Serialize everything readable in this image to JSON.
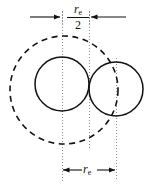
{
  "figure": {
    "background_color": "#ffffff",
    "line_color": "#111111",
    "guide_color": "#999999",
    "width": 154,
    "height": 185
  },
  "labels": {
    "top_dimension": {
      "numerator_symbol": "r",
      "numerator_subscript": "e",
      "denominator": "2",
      "full_text": "r_e/2"
    },
    "bottom_dimension": {
      "symbol": "r",
      "subscript": "e",
      "full_text": "r_e"
    }
  },
  "geometry": {
    "type": "technical-drawing",
    "solid_circles": [
      {
        "name": "left-circle",
        "cx": 62,
        "cy": 84,
        "r": 27,
        "stroke": "#111111",
        "style": "solid"
      },
      {
        "name": "right-circle",
        "cx": 116,
        "cy": 89,
        "r": 27,
        "stroke": "#111111",
        "style": "solid"
      }
    ],
    "dashed_circles": [
      {
        "name": "reference-circle",
        "cx": 64,
        "cy": 90,
        "r": 54,
        "stroke": "#111111",
        "style": "dashed"
      }
    ],
    "center_lines": [
      {
        "name": "left-center-line",
        "x": 62,
        "y1": 12,
        "y2": 180,
        "style": "dotted"
      },
      {
        "name": "mid-center-line",
        "x": 89,
        "y1": 12,
        "y2": 150,
        "style": "dotted"
      },
      {
        "name": "right-center-line",
        "x": 116,
        "y1": 60,
        "y2": 180,
        "style": "dotted"
      }
    ],
    "dimensions": [
      {
        "name": "top-dimension",
        "y": 17,
        "from_x": 62,
        "to_x": 89,
        "arrow_direction": "inward",
        "extension_left_x": 30,
        "extension_right_x": 126,
        "label": "r_e/2"
      },
      {
        "name": "bottom-dimension",
        "y": 170,
        "from_x": 62,
        "to_x": 116,
        "arrow_direction": "outward",
        "label": "r_e"
      }
    ]
  }
}
